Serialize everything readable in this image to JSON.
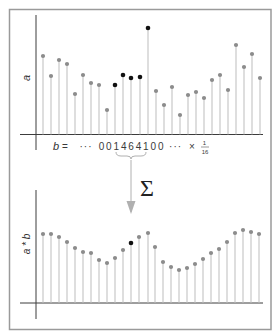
{
  "figure": {
    "top_plot": {
      "ylabel": "a",
      "baseline_y": 134.5,
      "axis": {
        "x_start": 20,
        "x_end": 263,
        "v_x": 36,
        "v_top": 15,
        "v_bottom": 150
      },
      "stems": [
        {
          "x": 43,
          "y": 56,
          "highlight": false
        },
        {
          "x": 51,
          "y": 76,
          "highlight": false
        },
        {
          "x": 59,
          "y": 60,
          "highlight": false
        },
        {
          "x": 67,
          "y": 64,
          "highlight": false
        },
        {
          "x": 75,
          "y": 94,
          "highlight": false
        },
        {
          "x": 83,
          "y": 75,
          "highlight": false
        },
        {
          "x": 91,
          "y": 83,
          "highlight": false
        },
        {
          "x": 99,
          "y": 85,
          "highlight": false
        },
        {
          "x": 107,
          "y": 110,
          "highlight": false
        },
        {
          "x": 115,
          "y": 85,
          "highlight": true
        },
        {
          "x": 123,
          "y": 75,
          "highlight": true
        },
        {
          "x": 131,
          "y": 78,
          "highlight": true
        },
        {
          "x": 140,
          "y": 77,
          "highlight": true
        },
        {
          "x": 148,
          "y": 28,
          "highlight": true
        },
        {
          "x": 156,
          "y": 91,
          "highlight": false
        },
        {
          "x": 164,
          "y": 105,
          "highlight": false
        },
        {
          "x": 172,
          "y": 87,
          "highlight": false
        },
        {
          "x": 180,
          "y": 115,
          "highlight": false
        },
        {
          "x": 188,
          "y": 95,
          "highlight": false
        },
        {
          "x": 196,
          "y": 92,
          "highlight": false
        },
        {
          "x": 204,
          "y": 98,
          "highlight": false
        },
        {
          "x": 212,
          "y": 80,
          "highlight": false
        },
        {
          "x": 220,
          "y": 75,
          "highlight": false
        },
        {
          "x": 228,
          "y": 90,
          "highlight": false
        },
        {
          "x": 236,
          "y": 45,
          "highlight": false
        },
        {
          "x": 244,
          "y": 67,
          "highlight": false
        },
        {
          "x": 252,
          "y": 54,
          "highlight": false
        },
        {
          "x": 260,
          "y": 78,
          "highlight": false
        }
      ]
    },
    "kernel": {
      "lhs": "b",
      "equals": "=",
      "sequence": "··· 0 0 1 4 6 4 1 0 0 ···",
      "times": "×",
      "scale_numerator": "1",
      "scale_denominator": "16",
      "digits": [
        "0",
        "0",
        "1",
        "4",
        "6",
        "4",
        "1",
        "0",
        "0"
      ]
    },
    "operator": {
      "symbol": "Σ",
      "icon": "sigma-sum-icon"
    },
    "bottom_plot": {
      "ylabel": "a * b",
      "baseline_y": 303,
      "axis": {
        "x_start": 20,
        "x_end": 263,
        "v_x": 36,
        "v_top": 190,
        "v_bottom": 319
      },
      "stems": [
        {
          "x": 43,
          "y": 234,
          "highlight": false
        },
        {
          "x": 51,
          "y": 234,
          "highlight": false
        },
        {
          "x": 59,
          "y": 237,
          "highlight": false
        },
        {
          "x": 67,
          "y": 242,
          "highlight": false
        },
        {
          "x": 75,
          "y": 248,
          "highlight": false
        },
        {
          "x": 83,
          "y": 252,
          "highlight": false
        },
        {
          "x": 91,
          "y": 253,
          "highlight": false
        },
        {
          "x": 99,
          "y": 260,
          "highlight": false
        },
        {
          "x": 107,
          "y": 263,
          "highlight": false
        },
        {
          "x": 115,
          "y": 258,
          "highlight": false
        },
        {
          "x": 123,
          "y": 250,
          "highlight": false
        },
        {
          "x": 131,
          "y": 243,
          "highlight": true
        },
        {
          "x": 139,
          "y": 237,
          "highlight": false
        },
        {
          "x": 148,
          "y": 233,
          "highlight": false
        },
        {
          "x": 155,
          "y": 247,
          "highlight": false
        },
        {
          "x": 163,
          "y": 262,
          "highlight": false
        },
        {
          "x": 171,
          "y": 267,
          "highlight": false
        },
        {
          "x": 179,
          "y": 270,
          "highlight": false
        },
        {
          "x": 187,
          "y": 268,
          "highlight": false
        },
        {
          "x": 195,
          "y": 264,
          "highlight": false
        },
        {
          "x": 203,
          "y": 259,
          "highlight": false
        },
        {
          "x": 211,
          "y": 253,
          "highlight": false
        },
        {
          "x": 219,
          "y": 249,
          "highlight": false
        },
        {
          "x": 227,
          "y": 242,
          "highlight": false
        },
        {
          "x": 235,
          "y": 233,
          "highlight": false
        },
        {
          "x": 243,
          "y": 230,
          "highlight": false
        },
        {
          "x": 251,
          "y": 232,
          "highlight": false
        },
        {
          "x": 259,
          "y": 234,
          "highlight": false
        }
      ]
    },
    "colors": {
      "dot_normal": "#8c8c8c",
      "dot_highlight": "#111111",
      "stem": "#bdbdbd",
      "axis": "#3c3c3c",
      "frame": "#9a9a9a"
    }
  }
}
